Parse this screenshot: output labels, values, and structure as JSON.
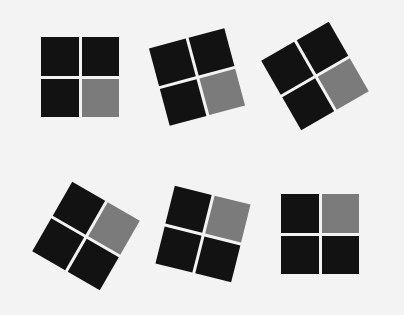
{
  "colors": {
    "background": "#f3f3f3",
    "dark_tile": "#121212",
    "gray_tile": "#7b7b7b"
  },
  "figures": [
    {
      "id": 1,
      "center_x": 80,
      "center_y": 77,
      "rotation_deg": 0,
      "gray_quadrant": "bottom-right"
    },
    {
      "id": 2,
      "center_x": 197,
      "center_y": 77,
      "rotation_deg": -15,
      "gray_quadrant": "bottom-right"
    },
    {
      "id": 3,
      "center_x": 315,
      "center_y": 76,
      "rotation_deg": -30,
      "gray_quadrant": "bottom-right"
    },
    {
      "id": 4,
      "center_x": 86,
      "center_y": 236,
      "rotation_deg": 30,
      "gray_quadrant": "top-right"
    },
    {
      "id": 5,
      "center_x": 203,
      "center_y": 234,
      "rotation_deg": 14,
      "gray_quadrant": "top-right"
    },
    {
      "id": 6,
      "center_x": 320,
      "center_y": 234,
      "rotation_deg": 0,
      "gray_quadrant": "top-right"
    }
  ]
}
